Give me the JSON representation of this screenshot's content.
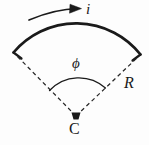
{
  "figure": {
    "background_color": "#fdfdfd",
    "stroke_color": "#1a1a1a",
    "labels": {
      "current": "i",
      "angle": "ϕ",
      "radius": "R",
      "center": "C"
    },
    "elements": {
      "current_arrow_name": "current-direction-arrow",
      "outer_arc_name": "thick-conductor-arc",
      "inner_arc_name": "angle-indicator-arc",
      "left_radius_name": "left-radius-dashed-line",
      "right_radius_name": "right-radius-dashed-line",
      "center_point_name": "center-point-marker"
    },
    "geometry": {
      "center_x": 76,
      "center_y": 117,
      "radius": 82,
      "arc_start_x": 14,
      "arc_start_y": 53,
      "arc_end_x": 140,
      "arc_end_y": 55,
      "arc_apex_x": 76,
      "arc_apex_y": 29,
      "inner_arc_radius": 40,
      "outer_arc_stroke_width": 2.6,
      "dash_pattern": "4 3"
    }
  }
}
